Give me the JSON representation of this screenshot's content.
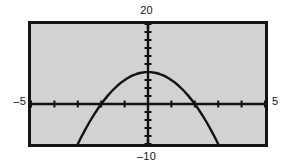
{
  "screen": {
    "name": "graphing-calculator-screen",
    "background_color": "#ffffff",
    "viewport_background_color": "#d2d2d2",
    "frame_color": "#141414",
    "curve_color": "#121212"
  },
  "labels": {
    "y_max": "20",
    "y_min": "–10",
    "x_min": "–5",
    "x_max": "5"
  },
  "chart_data": {
    "type": "line",
    "title": "",
    "xlabel": "",
    "ylabel": "",
    "xlim": [
      -5,
      5
    ],
    "ylim": [
      -10,
      20
    ],
    "grid": false,
    "legend": null,
    "x_tick_step": 1,
    "y_tick_step": 2,
    "axis_ticks_visible": true,
    "curve": {
      "name": "parabola",
      "shape": "downward-opening parabola",
      "vertex": [
        0,
        8
      ],
      "x_intercepts": [
        -2,
        2
      ],
      "x": [
        -3.1,
        -2.9,
        -2.7,
        -2.5,
        -2.3,
        -2.1,
        -1.9,
        -1.7,
        -1.5,
        -1.3,
        -1.1,
        -0.9,
        -0.7,
        -0.5,
        -0.3,
        -0.1,
        0.1,
        0.3,
        0.5,
        0.7,
        0.9,
        1.1,
        1.3,
        1.5,
        1.7,
        1.9,
        2.1,
        2.3,
        2.5,
        2.7,
        2.9,
        3.1
      ],
      "y": [
        -11.22,
        -8.82,
        -6.58,
        -4.5,
        -2.58,
        -0.82,
        0.78,
        2.22,
        3.5,
        4.62,
        5.58,
        6.38,
        7.02,
        7.5,
        7.82,
        7.98,
        7.98,
        7.82,
        7.5,
        7.02,
        6.38,
        5.58,
        4.62,
        3.5,
        2.22,
        0.78,
        -0.82,
        -2.58,
        -4.5,
        -6.58,
        -8.82,
        -11.22
      ]
    }
  }
}
